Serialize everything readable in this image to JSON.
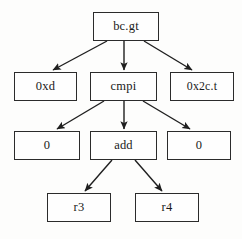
{
  "diagram": {
    "kind": "expression-tree",
    "background_color": "#fdfdfc",
    "node_fill_color": "#fefefe",
    "node_border_color": "#2b2b2b",
    "edge_color": "#1f1f1f",
    "nodes": [
      {
        "id": "root",
        "label": "bc.gt",
        "x": 93,
        "y": 12,
        "w": 66,
        "h": 29,
        "level": 0
      },
      {
        "id": "left1",
        "label": "0xd",
        "x": 14,
        "y": 72,
        "w": 63,
        "h": 29,
        "level": 1
      },
      {
        "id": "mid1",
        "label": "cmpi",
        "x": 90,
        "y": 72,
        "w": 67,
        "h": 29,
        "level": 1
      },
      {
        "id": "right1",
        "label": "0x2c.t",
        "x": 170,
        "y": 72,
        "w": 64,
        "h": 29,
        "level": 1
      },
      {
        "id": "left2",
        "label": "0",
        "x": 14,
        "y": 131,
        "w": 66,
        "h": 29,
        "level": 2
      },
      {
        "id": "mid2",
        "label": "add",
        "x": 90,
        "y": 131,
        "w": 67,
        "h": 29,
        "level": 2
      },
      {
        "id": "right2",
        "label": "0",
        "x": 167,
        "y": 131,
        "w": 64,
        "h": 29,
        "level": 2
      },
      {
        "id": "leaf_r3",
        "label": "r3",
        "x": 47,
        "y": 193,
        "w": 64,
        "h": 29,
        "level": 3
      },
      {
        "id": "leaf_r4",
        "label": "r4",
        "x": 135,
        "y": 193,
        "w": 64,
        "h": 29,
        "level": 3
      }
    ],
    "edges": [
      {
        "from": "root",
        "to": "left1",
        "x1": 107,
        "y1": 41,
        "x2": 53,
        "y2": 70
      },
      {
        "from": "root",
        "to": "mid1",
        "x1": 124,
        "y1": 41,
        "x2": 124,
        "y2": 70
      },
      {
        "from": "root",
        "to": "right1",
        "x1": 144,
        "y1": 41,
        "x2": 192,
        "y2": 70
      },
      {
        "from": "mid1",
        "to": "left2",
        "x1": 104,
        "y1": 101,
        "x2": 57,
        "y2": 129
      },
      {
        "from": "mid1",
        "to": "mid2",
        "x1": 124,
        "y1": 101,
        "x2": 124,
        "y2": 129
      },
      {
        "from": "mid1",
        "to": "right2",
        "x1": 143,
        "y1": 101,
        "x2": 190,
        "y2": 129
      },
      {
        "from": "mid2",
        "to": "leaf_r3",
        "x1": 112,
        "y1": 160,
        "x2": 85,
        "y2": 191
      },
      {
        "from": "mid2",
        "to": "leaf_r4",
        "x1": 135,
        "y1": 160,
        "x2": 162,
        "y2": 191
      }
    ]
  }
}
